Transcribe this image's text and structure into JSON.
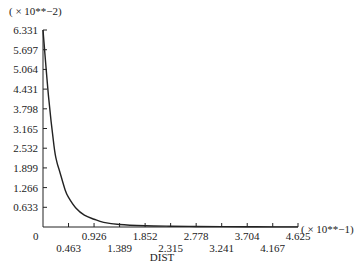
{
  "chart_data": {
    "type": "line",
    "title": "",
    "xlabel": "DIST",
    "ylabel": "",
    "x_scale_note": "( × 10**−1)",
    "y_scale_note": "( × 10**−2)",
    "xlim": [
      0,
      4.625
    ],
    "ylim": [
      0,
      6.331
    ],
    "grid": false,
    "legend": null,
    "x_ticks": [
      "0",
      "0.463",
      "0.926",
      "1.389",
      "1.852",
      "2.315",
      "2.778",
      "3.241",
      "3.704",
      "4.167",
      "4.625"
    ],
    "y_ticks": [
      "0.633",
      "1.266",
      "1.899",
      "2.532",
      "3.165",
      "3.798",
      "4.431",
      "5.064",
      "5.697",
      "6.331"
    ],
    "y_zero_label": "0",
    "series": [
      {
        "name": "curve",
        "x": [
          0.0,
          0.1,
          0.2,
          0.25,
          0.3,
          0.4,
          0.463,
          0.6,
          0.75,
          0.926,
          1.1,
          1.389,
          1.852,
          2.315,
          2.778,
          3.241,
          3.704,
          4.167,
          4.625
        ],
        "y": [
          6.331,
          4.2,
          2.6,
          2.1,
          1.8,
          1.2,
          0.95,
          0.6,
          0.38,
          0.25,
          0.15,
          0.08,
          0.04,
          0.025,
          0.018,
          0.012,
          0.008,
          0.005,
          0.003
        ]
      }
    ]
  },
  "labels": {
    "y_scale_note": "( × 10**−2)",
    "x_scale_note": "( × 10**−1)",
    "xlabel": "DIST",
    "y_zero": "0"
  }
}
